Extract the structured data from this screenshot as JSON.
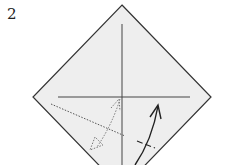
{
  "step_number": "2",
  "paper_color": "#eeeeee",
  "line_color": "#333333"
}
